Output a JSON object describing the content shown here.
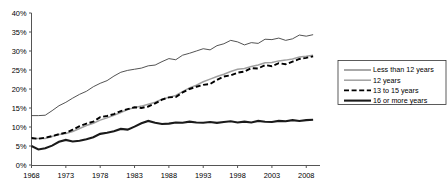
{
  "chart_data": {
    "type": "line",
    "title": "",
    "xlabel": "",
    "ylabel": "",
    "xlim": [
      1968,
      2010
    ],
    "ylim": [
      0,
      40
    ],
    "ytick_labels": [
      "0%",
      "5%",
      "10%",
      "15%",
      "20%",
      "25%",
      "30%",
      "35%",
      "40%"
    ],
    "ytick_values": [
      0,
      5,
      10,
      15,
      20,
      25,
      30,
      35,
      40
    ],
    "xtick_labels": [
      "1968",
      "1973",
      "1978",
      "1983",
      "1988",
      "1993",
      "1998",
      "2003",
      "2008"
    ],
    "xtick_values": [
      1968,
      1973,
      1978,
      1983,
      1988,
      1993,
      1998,
      2003,
      2008
    ],
    "grid": false,
    "legend_position": "right",
    "x": [
      1968,
      1969,
      1970,
      1971,
      1972,
      1973,
      1974,
      1975,
      1976,
      1977,
      1978,
      1979,
      1980,
      1981,
      1982,
      1983,
      1984,
      1985,
      1986,
      1987,
      1988,
      1989,
      1990,
      1991,
      1992,
      1993,
      1994,
      1995,
      1996,
      1997,
      1998,
      1999,
      2000,
      2001,
      2002,
      2003,
      2004,
      2005,
      2006,
      2007,
      2008,
      2009
    ],
    "series": [
      {
        "name": "Less than 12 years",
        "style": "thin-solid-gray",
        "color": "#404040",
        "values": [
          13.0,
          13.0,
          13.1,
          14.3,
          15.6,
          16.5,
          17.6,
          18.6,
          19.4,
          20.6,
          21.5,
          22.2,
          23.4,
          24.4,
          24.9,
          25.2,
          25.5,
          26.1,
          26.3,
          27.2,
          28.0,
          27.7,
          28.9,
          29.4,
          30.0,
          30.6,
          30.3,
          31.4,
          31.9,
          32.8,
          32.4,
          31.6,
          32.2,
          32.0,
          33.1,
          33.0,
          33.4,
          32.8,
          33.2,
          34.2,
          33.9,
          34.3
        ]
      },
      {
        "name": "12 years",
        "style": "medium-solid-lightgray",
        "color": "#a0a0a0",
        "values": [
          6.9,
          7.0,
          7.0,
          7.5,
          8.0,
          8.3,
          8.8,
          9.6,
          10.4,
          11.0,
          11.8,
          12.4,
          13.1,
          13.8,
          14.6,
          15.1,
          15.5,
          16.0,
          16.5,
          17.3,
          17.8,
          18.3,
          19.3,
          20.3,
          21.0,
          21.9,
          22.6,
          23.3,
          23.9,
          24.6,
          25.2,
          25.4,
          25.9,
          26.3,
          26.9,
          27.0,
          27.4,
          27.6,
          27.9,
          28.4,
          28.6,
          28.9
        ]
      },
      {
        "name": "13 to 15 years",
        "style": "dashed-black",
        "color": "#000000",
        "values": [
          7.1,
          6.9,
          7.2,
          7.6,
          8.1,
          8.5,
          9.3,
          10.2,
          10.9,
          11.4,
          12.6,
          12.9,
          13.4,
          14.2,
          14.7,
          15.2,
          15.0,
          15.4,
          16.2,
          17.2,
          17.8,
          17.9,
          19.1,
          20.0,
          20.6,
          21.1,
          21.3,
          22.4,
          23.3,
          23.6,
          24.3,
          24.6,
          25.5,
          25.4,
          26.3,
          26.0,
          26.8,
          26.5,
          27.2,
          27.9,
          28.2,
          28.6
        ]
      },
      {
        "name": "16 or more years",
        "style": "thick-solid-black",
        "color": "#1a1a1a",
        "values": [
          5.0,
          4.1,
          4.4,
          5.1,
          6.1,
          6.6,
          6.2,
          6.4,
          6.8,
          7.3,
          8.2,
          8.5,
          8.9,
          9.5,
          9.3,
          10.1,
          11.0,
          11.6,
          11.1,
          10.8,
          10.9,
          11.2,
          11.1,
          11.4,
          11.2,
          11.1,
          11.3,
          11.1,
          11.3,
          11.5,
          11.2,
          11.4,
          11.2,
          11.6,
          11.4,
          11.3,
          11.6,
          11.5,
          11.8,
          11.6,
          11.8,
          11.9
        ]
      }
    ],
    "legend": [
      {
        "label": "Less than 12 years",
        "style": "thin-solid-gray"
      },
      {
        "label": "12 years",
        "style": "medium-solid-lightgray"
      },
      {
        "label": "13 to 15 years",
        "style": "dashed-black"
      },
      {
        "label": "16 or more years",
        "style": "thick-solid-black"
      }
    ]
  }
}
